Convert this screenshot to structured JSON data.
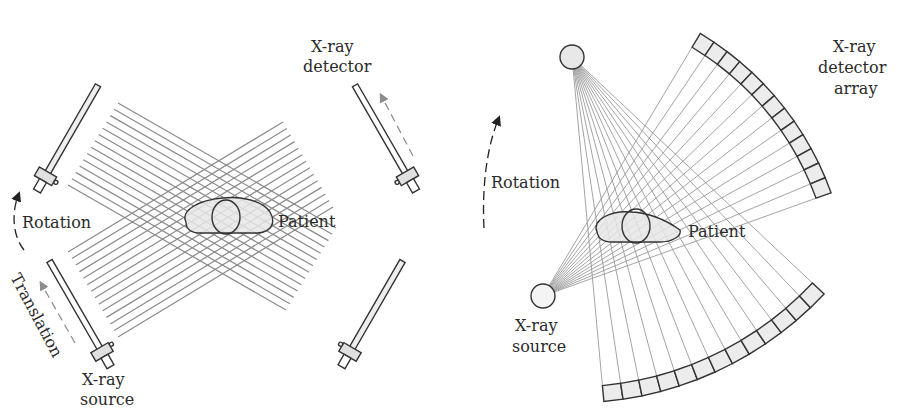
{
  "figure": {
    "left_panel": {
      "title": "First-generation CT (translate-rotate)",
      "labels": {
        "detector_line1": "X-ray",
        "detector_line2": "detector",
        "source_line1": "X-ray",
        "source_line2": "source",
        "rotation": "Rotation",
        "translation": "Translation",
        "patient": "Patient"
      },
      "beam_count_per_view": 14
    },
    "right_panel": {
      "title": "Fan-beam CT (rotate)",
      "labels": {
        "detector_line1": "X-ray",
        "detector_line2": "detector",
        "detector_line3": "array",
        "source_line1": "X-ray",
        "source_line2": "source",
        "rotation": "Rotation",
        "patient": "Patient"
      },
      "detector_cells_top": 13,
      "detector_cells_bottom": 13
    },
    "colors": {
      "outline": "#333333",
      "fill": "#e6e6e6",
      "beam": "#8a8a8a",
      "arrow_gray": "#8c8c8c",
      "text": "#2a2a2a"
    }
  }
}
